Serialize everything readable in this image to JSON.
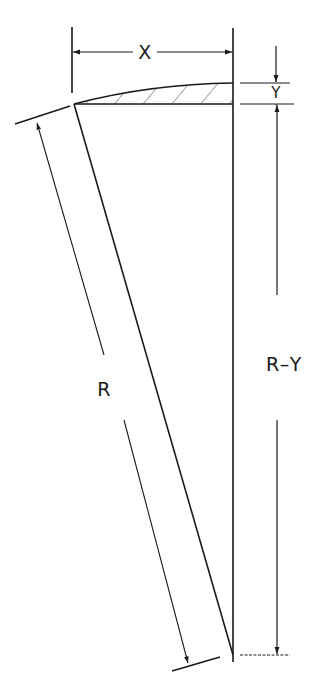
{
  "diagram": {
    "type": "geometric-dimension-drawing",
    "labels": {
      "x": "X",
      "y": "Y",
      "r": "R",
      "r_minus_y": "R–Y"
    },
    "colors": {
      "ink": "#1a1a1a",
      "background": "#ffffff"
    }
  }
}
